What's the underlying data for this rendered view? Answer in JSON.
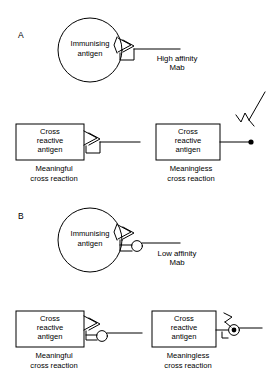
{
  "figure": {
    "background_color": "#ffffff",
    "ink_color": "#000000",
    "width": 275,
    "height": 389
  },
  "panels": [
    {
      "letter": "A",
      "subject": "high-affinity-monoclonal-antibody",
      "antigen_shape": "circle",
      "antigen_label_line1": "Immunising",
      "antigen_label_line2": "antigen",
      "mab_label_line1": "High affinity",
      "mab_label_line2": "Mab",
      "cross_reactions": [
        {
          "box_label_line1": "Cross",
          "box_label_line2": "reactive",
          "box_label_line3": "antigen",
          "caption_line1": "Meaningful",
          "caption_line2": "cross reaction",
          "bound": "true"
        },
        {
          "box_label_line1": "Cross",
          "box_label_line2": "reactive",
          "box_label_line3": "antigen",
          "caption_line1": "Meaningless",
          "caption_line2": "cross reaction",
          "bound": "false"
        }
      ]
    },
    {
      "letter": "B",
      "subject": "low-affinity-monoclonal-antibody",
      "antigen_shape": "circle",
      "antigen_label_line1": "Immunising",
      "antigen_label_line2": "antigen",
      "mab_label_line1": "Low affinity",
      "mab_label_line2": "Mab",
      "cross_reactions": [
        {
          "box_label_line1": "Cross",
          "box_label_line2": "reactive",
          "box_label_line3": "antigen",
          "caption_line1": "Meaningful",
          "caption_line2": "cross reaction",
          "bound": "true"
        },
        {
          "box_label_line1": "Cross",
          "box_label_line2": "reactive",
          "box_label_line3": "antigen",
          "caption_line1": "Meaningless",
          "caption_line2": "cross reaction",
          "bound": "false"
        }
      ]
    }
  ],
  "free_antibody": {
    "name": "unbound-antibody-symbol",
    "description": "Y-shaped free antibody"
  }
}
